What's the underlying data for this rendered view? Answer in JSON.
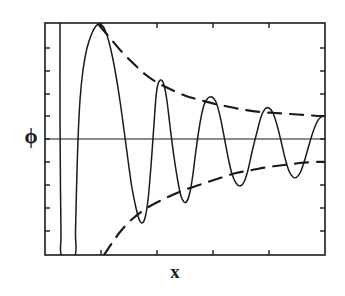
{
  "figure": {
    "type": "line-plot",
    "background_color": "#ffffff",
    "ink_color": "#1a1a1a"
  },
  "axes": {
    "frame": {
      "left": 45,
      "top": 23,
      "right": 325,
      "bottom": 255
    },
    "zero_line_y": 139,
    "ylabel": "ϕ",
    "xlabel": "x",
    "left_ticks_y": [
      48,
      71,
      94,
      116,
      139,
      162,
      185,
      208,
      231
    ],
    "right_ticks_y": [
      48,
      71,
      94,
      116,
      139,
      162,
      185,
      208,
      231
    ],
    "bottom_ticks_x": [
      101,
      157,
      213,
      269
    ],
    "top_ticks_x": [
      101,
      157,
      213,
      269
    ],
    "tick_length": 5,
    "frame_stroke_width": 1.6
  },
  "chart_data": {
    "type": "line",
    "title": "",
    "xlabel": "x",
    "ylabel": "ϕ",
    "grid": false,
    "legend": null,
    "axis_tick_labels": {
      "x": [],
      "y": []
    },
    "series": [
      {
        "name": "phi",
        "style": "solid",
        "stroke_width": 1.5,
        "points": [
          [
            60,
            23
          ],
          [
            60,
            120
          ],
          [
            60.5,
            190
          ],
          [
            61,
            235
          ],
          [
            61.5,
            255
          ],
          [
            75,
            255
          ],
          [
            75.5,
            232
          ],
          [
            76.5,
            190
          ],
          [
            78,
            140
          ],
          [
            80,
            100
          ],
          [
            83,
            70
          ],
          [
            87,
            48
          ],
          [
            92,
            33
          ],
          [
            96,
            26
          ],
          [
            100,
            24
          ],
          [
            105,
            30
          ],
          [
            110,
            46
          ],
          [
            115,
            70
          ],
          [
            120,
            101
          ],
          [
            124,
            130
          ],
          [
            128,
            160
          ],
          [
            132,
            188
          ],
          [
            136,
            208
          ],
          [
            139,
            219
          ],
          [
            142,
            223
          ],
          [
            145,
            218
          ],
          [
            148,
            200
          ],
          [
            151,
            166
          ],
          [
            154,
            124
          ],
          [
            156,
            97
          ],
          [
            158,
            84
          ],
          [
            161,
            80
          ],
          [
            164,
            85
          ],
          [
            167,
            101
          ],
          [
            170,
            126
          ],
          [
            174,
            157
          ],
          [
            178,
            182
          ],
          [
            181,
            196
          ],
          [
            184,
            202
          ],
          [
            187,
            201
          ],
          [
            190,
            192
          ],
          [
            193,
            174
          ],
          [
            196,
            150
          ],
          [
            200,
            123
          ],
          [
            204,
            105
          ],
          [
            208,
            98
          ],
          [
            212,
            97
          ],
          [
            216,
            102
          ],
          [
            220,
            116
          ],
          [
            224,
            136
          ],
          [
            228,
            157
          ],
          [
            232,
            174
          ],
          [
            236,
            183
          ],
          [
            240,
            186
          ],
          [
            244,
            182
          ],
          [
            248,
            170
          ],
          [
            252,
            152
          ],
          [
            257,
            132
          ],
          [
            261,
            117
          ],
          [
            265,
            109
          ],
          [
            269,
            108
          ],
          [
            273,
            113
          ],
          [
            277,
            125
          ],
          [
            281,
            141
          ],
          [
            285,
            158
          ],
          [
            289,
            171
          ],
          [
            293,
            177
          ],
          [
            297,
            177
          ],
          [
            301,
            171
          ],
          [
            305,
            159
          ],
          [
            309,
            145
          ],
          [
            313,
            132
          ],
          [
            317,
            122
          ],
          [
            321,
            117
          ],
          [
            325,
            116
          ]
        ]
      },
      {
        "name": "upper-envelope",
        "style": "dashed",
        "stroke_width": 2.2,
        "dash_pattern": "13 9",
        "points": [
          [
            99,
            25
          ],
          [
            110,
            38
          ],
          [
            122,
            52
          ],
          [
            134,
            64
          ],
          [
            146,
            75
          ],
          [
            158,
            83
          ],
          [
            172,
            90
          ],
          [
            186,
            96
          ],
          [
            200,
            100
          ],
          [
            215,
            104
          ],
          [
            230,
            107
          ],
          [
            245,
            110
          ],
          [
            260,
            112
          ],
          [
            275,
            113
          ],
          [
            290,
            114
          ],
          [
            305,
            115
          ],
          [
            320,
            116
          ],
          [
            325,
            116
          ]
        ]
      },
      {
        "name": "lower-envelope",
        "style": "dashed",
        "stroke_width": 2.2,
        "dash_pattern": "13 9",
        "points": [
          [
            104,
            255
          ],
          [
            112,
            243
          ],
          [
            120,
            232
          ],
          [
            130,
            221
          ],
          [
            141,
            212
          ],
          [
            152,
            205
          ],
          [
            164,
            199
          ],
          [
            177,
            193
          ],
          [
            190,
            188
          ],
          [
            205,
            183
          ],
          [
            220,
            178
          ],
          [
            236,
            173
          ],
          [
            252,
            170
          ],
          [
            268,
            167
          ],
          [
            284,
            165
          ],
          [
            300,
            163
          ],
          [
            316,
            162
          ],
          [
            325,
            162
          ]
        ]
      }
    ]
  }
}
